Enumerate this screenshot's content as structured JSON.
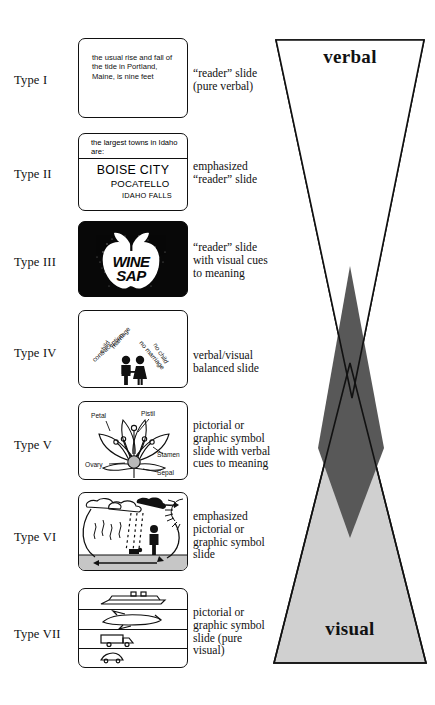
{
  "diagram": {
    "cone": {
      "top_label": "verbal",
      "bottom_label": "visual",
      "verbal_fill": "#ffffff",
      "visual_fill": "#d0d0d0",
      "overlap_fill": "#585858",
      "outline": "#111111"
    },
    "rows": [
      {
        "type": "Type I",
        "description": "“reader” slide\n(pure verbal)",
        "slide_kind": "text-only",
        "slide_text": "the usual rise and fall of the tide in Portland, Maine, is nine feet"
      },
      {
        "type": "Type II",
        "description": "emphasized\n“reader” slide",
        "slide_kind": "emphasized-text",
        "header": "the largest towns in Idaho are:",
        "lines": [
          "BOISE CITY",
          "POCATELLO",
          "IDAHO FALLS"
        ]
      },
      {
        "type": "Type III",
        "description": "“reader” slide\nwith visual cues\nto meaning",
        "slide_kind": "dark-logo",
        "logo_words": [
          "WINE",
          "SAP"
        ]
      },
      {
        "type": "Type IV",
        "description": "verbal/visual\nbalanced slide",
        "slide_kind": "balanced",
        "ray_labels": [
          "child",
          "marriage",
          "contraception",
          "no marriage",
          "no child"
        ],
        "figure": "couple-holding-hands"
      },
      {
        "type": "Type V",
        "description": "pictorial or\ngraphic symbol\nslide with verbal\ncues to meaning",
        "slide_kind": "flower-diagram",
        "part_labels": [
          "Petal",
          "Pistil",
          "Stamen",
          "Ovary",
          "Sepal"
        ]
      },
      {
        "type": "Type VI",
        "description": "emphasized\npictorial or\ngraphic symbol\nslide",
        "slide_kind": "water-cycle",
        "elements": [
          "cloud",
          "rain",
          "sun",
          "person",
          "ground"
        ]
      },
      {
        "type": "Type VII",
        "description": "pictorial or\ngraphic symbol\nslide (pure\nvisual)",
        "slide_kind": "transport-bands",
        "bands": [
          "ship",
          "airplane",
          "truck",
          "car"
        ]
      }
    ]
  }
}
